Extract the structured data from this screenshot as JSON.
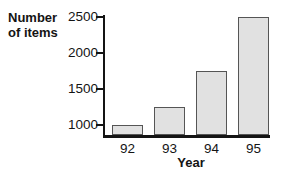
{
  "chart_data": {
    "type": "bar",
    "title": "",
    "xlabel": "Year",
    "ylabel": "Number of items",
    "ylabel_lines": [
      "Number",
      "of items"
    ],
    "categories": [
      "92",
      "93",
      "94",
      "95"
    ],
    "values": [
      1000,
      1250,
      1750,
      2500
    ],
    "yticks": [
      1000,
      1500,
      2000,
      2500
    ],
    "ylim": [
      850,
      2550
    ],
    "grid": false,
    "legend": false,
    "colors": {
      "bar_fill": "#e1e1e1",
      "bar_border": "#555555",
      "axis": "#141414",
      "text": "#141414",
      "background": "#ffffff"
    }
  }
}
